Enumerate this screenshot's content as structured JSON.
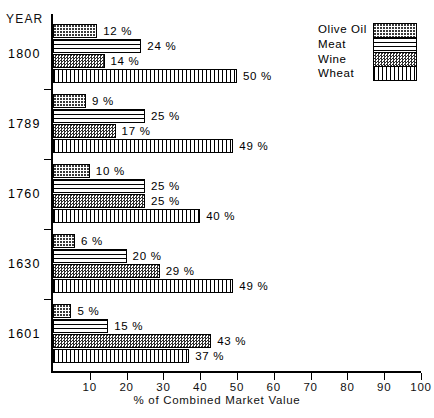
{
  "chart_data": {
    "type": "bar",
    "orientation": "horizontal",
    "title": "",
    "xlabel": "% of Combined Market Value",
    "ylabel": "YEAR",
    "xlim": [
      0,
      100
    ],
    "xticks": [
      10,
      20,
      30,
      40,
      50,
      60,
      70,
      80,
      90,
      100
    ],
    "grid": false,
    "legend_position": "top-right",
    "categories": [
      "1800",
      "1789",
      "1760",
      "1630",
      "1601"
    ],
    "series": [
      {
        "name": "Olive Oil",
        "pattern": "light-dots",
        "values": [
          12,
          9,
          10,
          6,
          5
        ]
      },
      {
        "name": "Meat",
        "pattern": "horizontal-lines",
        "values": [
          24,
          25,
          25,
          20,
          15
        ]
      },
      {
        "name": "Wine",
        "pattern": "dark-checker",
        "values": [
          14,
          17,
          25,
          29,
          43
        ]
      },
      {
        "name": "Wheat",
        "pattern": "vertical-lines",
        "values": [
          50,
          49,
          40,
          49,
          37
        ]
      }
    ],
    "value_label_suffix": "%",
    "groups": [
      {
        "year": "1800",
        "bars": [
          {
            "series": "Olive Oil",
            "value": 12,
            "label": "12 %"
          },
          {
            "series": "Meat",
            "value": 24,
            "label": "24 %"
          },
          {
            "series": "Wine",
            "value": 14,
            "label": "14 %"
          },
          {
            "series": "Wheat",
            "value": 50,
            "label": "50 %"
          }
        ]
      },
      {
        "year": "1789",
        "bars": [
          {
            "series": "Olive Oil",
            "value": 9,
            "label": "9 %"
          },
          {
            "series": "Meat",
            "value": 25,
            "label": "25 %"
          },
          {
            "series": "Wine",
            "value": 17,
            "label": "17 %"
          },
          {
            "series": "Wheat",
            "value": 49,
            "label": "49 %"
          }
        ]
      },
      {
        "year": "1760",
        "bars": [
          {
            "series": "Olive Oil",
            "value": 10,
            "label": "10 %"
          },
          {
            "series": "Meat",
            "value": 25,
            "label": "25 %"
          },
          {
            "series": "Wine",
            "value": 25,
            "label": "25 %"
          },
          {
            "series": "Wheat",
            "value": 40,
            "label": "40 %"
          }
        ]
      },
      {
        "year": "1630",
        "bars": [
          {
            "series": "Olive Oil",
            "value": 6,
            "label": "6 %"
          },
          {
            "series": "Meat",
            "value": 20,
            "label": "20 %"
          },
          {
            "series": "Wine",
            "value": 29,
            "label": "29 %"
          },
          {
            "series": "Wheat",
            "value": 49,
            "label": "49 %"
          }
        ]
      },
      {
        "year": "1601",
        "bars": [
          {
            "series": "Olive Oil",
            "value": 5,
            "label": "5 %"
          },
          {
            "series": "Meat",
            "value": 15,
            "label": "15 %"
          },
          {
            "series": "Wine",
            "value": 43,
            "label": "43 %"
          },
          {
            "series": "Wheat",
            "value": 37,
            "label": "37 %"
          }
        ]
      }
    ]
  },
  "axis": {
    "year_header": "YEAR",
    "x_title": "% of Combined Market Value",
    "tick_labels": [
      "10",
      "20",
      "30",
      "40",
      "50",
      "60",
      "70",
      "80",
      "90",
      "100"
    ]
  },
  "legend": {
    "items": [
      {
        "label": "Olive Oil",
        "pattern": "light-dots"
      },
      {
        "label": "Meat",
        "pattern": "horizontal-lines"
      },
      {
        "label": "Wine",
        "pattern": "dark-checker"
      },
      {
        "label": "Wheat",
        "pattern": "vertical-lines"
      }
    ]
  },
  "colors": {
    "foreground": "#000000",
    "background": "#ffffff"
  }
}
